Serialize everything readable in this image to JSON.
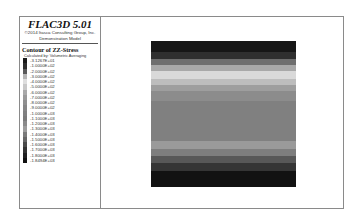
{
  "header": {
    "title": "FLAC3D 5.01",
    "copyright": "©2014 Itasca Consulting Group, Inc.",
    "model": "Demonstration Model"
  },
  "legend": {
    "contour_title": "Contour of ZZ-Stress",
    "calculated_by": "Calculated by: Volumetric Averaging",
    "scale": [
      {
        "label": "-3.1267E+01",
        "color": "#1a1a1a"
      },
      {
        "label": "-1.0000E+02",
        "color": "#2e2e2e"
      },
      {
        "label": "-2.0000E+02",
        "color": "#5a5a5a"
      },
      {
        "label": "-3.0000E+02",
        "color": "#b5b5b5"
      },
      {
        "label": "-4.0000E+02",
        "color": "#dedede"
      },
      {
        "label": "-5.0000E+02",
        "color": "#c8c8c8"
      },
      {
        "label": "-6.0000E+02",
        "color": "#a9a9a9"
      },
      {
        "label": "-7.0000E+02",
        "color": "#9a9a9a"
      },
      {
        "label": "-8.0000E+02",
        "color": "#8f8f8f"
      },
      {
        "label": "-9.0000E+02",
        "color": "#868686"
      },
      {
        "label": "-1.0000E+03",
        "color": "#808080"
      },
      {
        "label": "-1.1000E+03",
        "color": "#7b7b7b"
      },
      {
        "label": "-1.2000E+03",
        "color": "#8a8a8a"
      },
      {
        "label": "-1.3000E+03",
        "color": "#9c9c9c"
      },
      {
        "label": "-1.4000E+03",
        "color": "#7a7a7a"
      },
      {
        "label": "-1.5000E+03",
        "color": "#666666"
      },
      {
        "label": "-1.6000E+03",
        "color": "#4a4a4a"
      },
      {
        "label": "-1.7000E+03",
        "color": "#333333"
      },
      {
        "label": "-1.8000E+03",
        "color": "#202020"
      },
      {
        "label": "-1.8494E+03",
        "color": "#111111"
      }
    ]
  },
  "plot": {
    "bands": [
      {
        "color": "#161616",
        "height": 11
      },
      {
        "color": "#2f2f2f",
        "height": 7
      },
      {
        "color": "#6e6e6e",
        "height": 6
      },
      {
        "color": "#a8a8a8",
        "height": 6
      },
      {
        "color": "#d9d9d9",
        "height": 8
      },
      {
        "color": "#bdbdbd",
        "height": 6
      },
      {
        "color": "#9e9e9e",
        "height": 6
      },
      {
        "color": "#8c8c8c",
        "height": 10
      },
      {
        "color": "#808080",
        "height": 40
      },
      {
        "color": "#9a9a9a",
        "height": 8
      },
      {
        "color": "#7e7e7e",
        "height": 7
      },
      {
        "color": "#585858",
        "height": 7
      },
      {
        "color": "#353535",
        "height": 8
      },
      {
        "color": "#121212",
        "height": 16
      }
    ]
  }
}
